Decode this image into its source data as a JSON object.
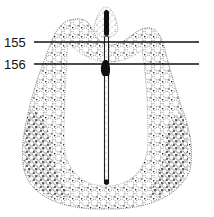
{
  "figure": {
    "type": "stippled anatomical cross-section illustration",
    "labels": [
      {
        "id": "155",
        "text": "155",
        "y": 42
      },
      {
        "id": "156",
        "text": "156",
        "y": 64
      }
    ]
  },
  "colors": {
    "background": "#ffffff",
    "ink": "#111111",
    "stipple": "#3a3a3a"
  }
}
